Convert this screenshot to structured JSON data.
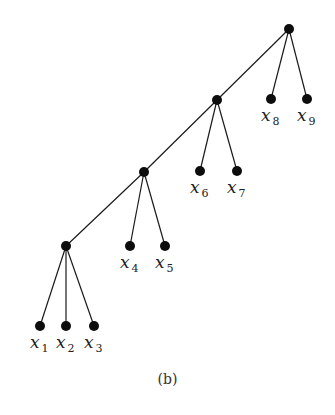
{
  "diagram": {
    "type": "tree",
    "caption": "(b)",
    "internal_nodes": [
      {
        "id": "root",
        "x": 289,
        "y": 29
      },
      {
        "id": "n1",
        "x": 217,
        "y": 100
      },
      {
        "id": "n2",
        "x": 144,
        "y": 172
      },
      {
        "id": "n3",
        "x": 66,
        "y": 246
      }
    ],
    "leaves": [
      {
        "id": "x1",
        "var": "x",
        "sub": "1",
        "x": 40,
        "y": 326,
        "parent": "n3"
      },
      {
        "id": "x2",
        "var": "x",
        "sub": "2",
        "x": 66,
        "y": 326,
        "parent": "n3"
      },
      {
        "id": "x3",
        "var": "x",
        "sub": "3",
        "x": 94,
        "y": 326,
        "parent": "n3"
      },
      {
        "id": "x4",
        "var": "x",
        "sub": "4",
        "x": 130,
        "y": 246,
        "parent": "n2"
      },
      {
        "id": "x5",
        "var": "x",
        "sub": "5",
        "x": 165,
        "y": 246,
        "parent": "n2"
      },
      {
        "id": "x6",
        "var": "x",
        "sub": "6",
        "x": 200,
        "y": 171,
        "parent": "n1"
      },
      {
        "id": "x7",
        "var": "x",
        "sub": "7",
        "x": 237,
        "y": 171,
        "parent": "n1"
      },
      {
        "id": "x8",
        "var": "x",
        "sub": "8",
        "x": 271,
        "y": 99,
        "parent": "root"
      },
      {
        "id": "x9",
        "var": "x",
        "sub": "9",
        "x": 307,
        "y": 99,
        "parent": "root"
      }
    ],
    "spine_edges": [
      [
        "root",
        "n1"
      ],
      [
        "n1",
        "n2"
      ],
      [
        "n2",
        "n3"
      ]
    ]
  }
}
